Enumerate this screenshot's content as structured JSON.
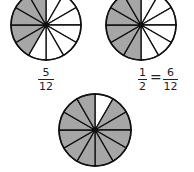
{
  "colors": {
    "shaded": "#a6a6a6",
    "unshaded": "#ffffff",
    "stroke": "#111111"
  },
  "circles": [
    {
      "id": "circle-5-12",
      "cx": 46,
      "cy": 25,
      "r": 35,
      "slices": 12,
      "shaded_slices": [
        7,
        8,
        9,
        10,
        11
      ]
    },
    {
      "id": "circle-6-12",
      "cx": 141,
      "cy": 25,
      "r": 35,
      "slices": 12,
      "shaded_slices": [
        6,
        7,
        8,
        9,
        10,
        11
      ]
    },
    {
      "id": "circle-11-12",
      "cx": 95,
      "cy": 130,
      "r": 36,
      "slices": 12,
      "shaded_slices": [
        1,
        2,
        3,
        4,
        5,
        6,
        7,
        8,
        9,
        10,
        11
      ]
    }
  ],
  "labels": {
    "first": {
      "num": "5",
      "den": "12"
    },
    "second": {
      "left": {
        "num": "1",
        "den": "2"
      },
      "equals": "=",
      "right": {
        "num": "6",
        "den": "12"
      }
    }
  }
}
